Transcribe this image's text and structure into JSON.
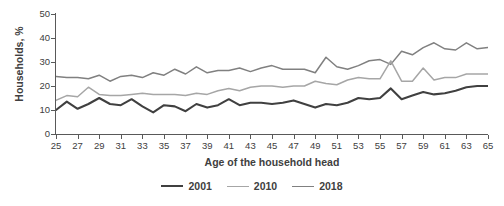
{
  "chart_data": {
    "type": "line",
    "title": "",
    "xlabel": "Age of the household head",
    "ylabel": "Households, %",
    "xlim": [
      25,
      65
    ],
    "ylim": [
      0,
      50
    ],
    "yticks": [
      0,
      10,
      20,
      30,
      40,
      50
    ],
    "xticks": [
      25,
      27,
      29,
      31,
      33,
      35,
      37,
      39,
      41,
      43,
      45,
      47,
      49,
      51,
      53,
      55,
      57,
      59,
      61,
      63,
      65
    ],
    "grid": false,
    "legend_position": "bottom-center",
    "x": [
      25,
      26,
      27,
      28,
      29,
      30,
      31,
      32,
      33,
      34,
      35,
      36,
      37,
      38,
      39,
      40,
      41,
      42,
      43,
      44,
      45,
      46,
      47,
      48,
      49,
      50,
      51,
      52,
      53,
      54,
      55,
      56,
      57,
      58,
      59,
      60,
      61,
      62,
      63,
      64,
      65
    ],
    "series": [
      {
        "name": "2001",
        "color": "#404040",
        "values": [
          10.0,
          13.5,
          10.5,
          12.5,
          15.0,
          12.5,
          12.0,
          14.5,
          11.5,
          9.0,
          12.0,
          11.5,
          9.5,
          12.5,
          11.0,
          12.0,
          14.5,
          12.0,
          13.0,
          13.0,
          12.5,
          13.0,
          14.0,
          12.5,
          11.0,
          12.5,
          12.0,
          13.0,
          15.0,
          14.5,
          15.0,
          19.0,
          14.5,
          16.0,
          17.5,
          16.5,
          17.0,
          18.0,
          19.5,
          20.0,
          20.0
        ]
      },
      {
        "name": "2010",
        "color": "#a6a6a6",
        "values": [
          14.0,
          16.0,
          15.5,
          19.5,
          16.5,
          16.0,
          16.0,
          16.5,
          17.0,
          16.5,
          16.5,
          16.5,
          16.0,
          17.0,
          16.5,
          18.0,
          19.0,
          18.0,
          19.5,
          20.0,
          20.0,
          19.5,
          20.0,
          20.0,
          22.0,
          21.0,
          20.5,
          22.5,
          23.5,
          23.0,
          23.0,
          30.5,
          22.0,
          22.0,
          27.5,
          22.5,
          23.5,
          23.5,
          25.0,
          25.0,
          25.0
        ]
      },
      {
        "name": "2018",
        "color": "#808080",
        "values": [
          24.0,
          23.5,
          23.5,
          23.0,
          24.5,
          22.0,
          24.0,
          24.5,
          23.5,
          25.5,
          24.5,
          27.0,
          25.0,
          28.0,
          25.5,
          26.5,
          26.5,
          27.5,
          26.0,
          27.5,
          28.5,
          27.0,
          27.0,
          27.0,
          25.5,
          32.0,
          28.0,
          27.0,
          28.5,
          30.5,
          31.0,
          29.0,
          34.5,
          33.0,
          36.0,
          38.0,
          35.5,
          35.0,
          38.0,
          35.5,
          36.0
        ]
      }
    ]
  },
  "legend": {
    "items": [
      {
        "label": "2001"
      },
      {
        "label": "2010"
      },
      {
        "label": "2018"
      }
    ]
  },
  "header": {
    "cropped_title": ""
  }
}
